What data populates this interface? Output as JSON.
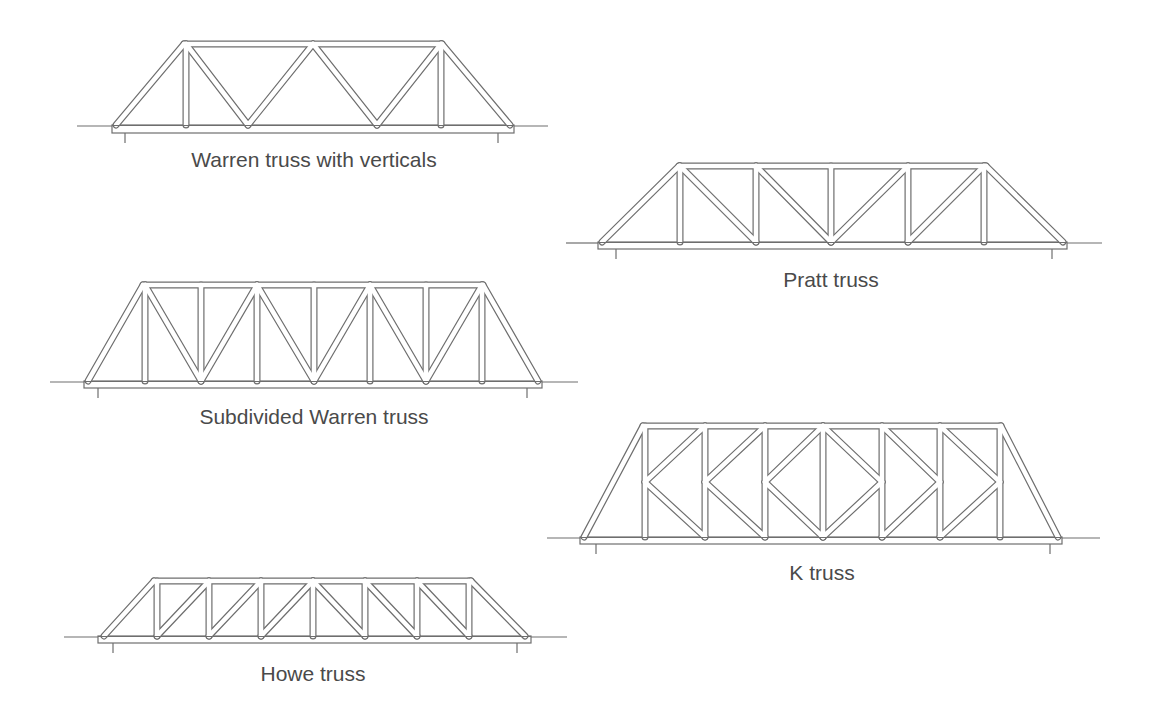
{
  "diagram": {
    "colors": {
      "line": "#6e6e6e",
      "fill": "#ffffff",
      "text": "#4a4a4a"
    },
    "trusses": [
      {
        "id": "warren-verticals",
        "label": "Warren truss with verticals",
        "label_pos": [
          314,
          148
        ],
        "ground": {
          "y": 126,
          "left": [
            77,
            112
          ],
          "right": [
            514,
            548
          ]
        },
        "bottom_chord": {
          "x1": 112,
          "x2": 514,
          "y1": 125,
          "y2": 133
        },
        "top_chord": {
          "x1": 184,
          "x2": 442,
          "y": 44
        },
        "bottom_line_y": 125,
        "ends": [
          [
            116,
            125
          ],
          [
            510,
            125
          ]
        ],
        "supports": [
          125,
          498
        ],
        "verticals": [
          186,
          441
        ],
        "members": [
          [
            186,
            44,
            186,
            125
          ],
          [
            441,
            44,
            441,
            125
          ],
          [
            186,
            44,
            248,
            125
          ],
          [
            248,
            125,
            313,
            44
          ],
          [
            313,
            44,
            377,
            125
          ],
          [
            377,
            125,
            441,
            44
          ]
        ]
      },
      {
        "id": "pratt",
        "label": "Pratt truss",
        "label_pos": [
          831,
          268
        ],
        "ground": {
          "y": 243,
          "left": [
            566,
            598
          ],
          "right": [
            1067,
            1102
          ]
        },
        "bottom_chord": {
          "x1": 598,
          "x2": 1067,
          "y1": 242,
          "y2": 249
        },
        "top_chord": {
          "x1": 679,
          "x2": 986,
          "y": 166
        },
        "ends": [
          [
            602,
            242
          ],
          [
            1063,
            242
          ]
        ],
        "supports": [
          616,
          1052
        ],
        "members": [
          [
            680,
            166,
            680,
            242
          ],
          [
            756,
            166,
            756,
            242
          ],
          [
            831,
            166,
            831,
            242
          ],
          [
            908,
            166,
            908,
            242
          ],
          [
            984,
            166,
            984,
            242
          ],
          [
            680,
            166,
            756,
            242
          ],
          [
            756,
            166,
            831,
            242
          ],
          [
            831,
            242,
            908,
            166
          ],
          [
            908,
            242,
            984,
            166
          ]
        ]
      },
      {
        "id": "subdivided-warren",
        "label": "Subdivided Warren truss",
        "label_pos": [
          314,
          405
        ],
        "ground": {
          "y": 382,
          "left": [
            50,
            84
          ],
          "right": [
            542,
            578
          ]
        },
        "bottom_chord": {
          "x1": 84,
          "x2": 542,
          "y1": 381,
          "y2": 388
        },
        "top_chord": {
          "x1": 143,
          "x2": 483,
          "y": 285
        },
        "ends": [
          [
            88,
            381
          ],
          [
            538,
            381
          ]
        ],
        "supports": [
          98,
          527
        ],
        "members": [
          [
            145,
            285,
            145,
            381
          ],
          [
            201,
            285,
            201,
            381
          ],
          [
            257,
            285,
            257,
            381
          ],
          [
            314,
            285,
            314,
            381
          ],
          [
            370,
            285,
            370,
            381
          ],
          [
            426,
            285,
            426,
            381
          ],
          [
            482,
            285,
            482,
            381
          ],
          [
            145,
            285,
            201,
            381
          ],
          [
            201,
            381,
            257,
            285
          ],
          [
            257,
            285,
            314,
            381
          ],
          [
            314,
            381,
            370,
            285
          ],
          [
            370,
            285,
            426,
            381
          ],
          [
            426,
            381,
            482,
            285
          ]
        ]
      },
      {
        "id": "k-truss",
        "label": "K truss",
        "label_pos": [
          822,
          561
        ],
        "ground": {
          "y": 538,
          "left": [
            547,
            580
          ],
          "right": [
            1062,
            1100
          ]
        },
        "bottom_chord": {
          "x1": 580,
          "x2": 1062,
          "y1": 537,
          "y2": 544
        },
        "top_chord": {
          "x1": 643,
          "x2": 1001,
          "y": 426
        },
        "ends": [
          [
            584,
            537
          ],
          [
            1058,
            537
          ]
        ],
        "supports": [
          596,
          1050
        ],
        "mid_y": 482,
        "members": [
          [
            645,
            426,
            645,
            537
          ],
          [
            705,
            426,
            705,
            537
          ],
          [
            765,
            426,
            765,
            537
          ],
          [
            823,
            426,
            823,
            537
          ],
          [
            882,
            426,
            882,
            537
          ],
          [
            940,
            426,
            940,
            537
          ],
          [
            1000,
            426,
            1000,
            537
          ],
          [
            645,
            482,
            705,
            426
          ],
          [
            645,
            482,
            705,
            537
          ],
          [
            705,
            482,
            765,
            426
          ],
          [
            705,
            482,
            765,
            537
          ],
          [
            765,
            482,
            823,
            426
          ],
          [
            765,
            482,
            823,
            537
          ],
          [
            882,
            482,
            823,
            426
          ],
          [
            882,
            482,
            823,
            537
          ],
          [
            940,
            482,
            882,
            426
          ],
          [
            940,
            482,
            882,
            537
          ],
          [
            1000,
            482,
            940,
            426
          ],
          [
            1000,
            482,
            940,
            537
          ]
        ]
      },
      {
        "id": "howe",
        "label": "Howe truss",
        "label_pos": [
          313,
          662
        ],
        "ground": {
          "y": 637,
          "left": [
            64,
            98
          ],
          "right": [
            531,
            567
          ]
        },
        "bottom_chord": {
          "x1": 98,
          "x2": 531,
          "y1": 636,
          "y2": 643
        },
        "top_chord": {
          "x1": 154,
          "x2": 471,
          "y": 581
        },
        "ends": [
          [
            104,
            636
          ],
          [
            525,
            636
          ]
        ],
        "supports": [
          113,
          517
        ],
        "members": [
          [
            157,
            581,
            157,
            636
          ],
          [
            209,
            581,
            209,
            636
          ],
          [
            261,
            581,
            261,
            636
          ],
          [
            313,
            581,
            313,
            636
          ],
          [
            365,
            581,
            365,
            636
          ],
          [
            417,
            581,
            417,
            636
          ],
          [
            469,
            581,
            469,
            636
          ],
          [
            157,
            636,
            209,
            581
          ],
          [
            209,
            636,
            261,
            581
          ],
          [
            261,
            636,
            313,
            581
          ],
          [
            313,
            581,
            365,
            636
          ],
          [
            365,
            581,
            417,
            636
          ],
          [
            417,
            581,
            469,
            636
          ]
        ]
      }
    ]
  }
}
